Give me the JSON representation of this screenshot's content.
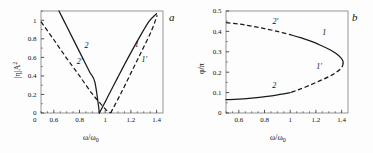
{
  "figure": {
    "background": "#fdfdfd",
    "curve_color": "#1a1a1a",
    "frame_color": "#8a8a8a"
  },
  "panel_a": {
    "tag": "a",
    "xlabel_main": "ω/ω",
    "xlabel_sub": "0",
    "ylabel_main": "|η|A",
    "ylabel_sup": "2"
  },
  "panel_b": {
    "tag": "b",
    "xlabel_main": "ω/ω",
    "xlabel_sub": "0",
    "ylabel_main": "φ/π"
  },
  "chart_data": [
    {
      "type": "line",
      "panel": "a",
      "title": "",
      "xlabel": "ω/ω₀",
      "ylabel": "|η|A²",
      "xlim": [
        0.5,
        1.45
      ],
      "ylim": [
        0,
        1.1
      ],
      "xticks": [
        0.6,
        0.8,
        1,
        1.2,
        1.4
      ],
      "xtick_labels": [
        "0.6",
        "0.8",
        "1",
        "1.2",
        "1.4"
      ],
      "yticks": [
        0,
        0.2,
        0.4,
        0.6,
        0.8,
        1
      ],
      "ytick_labels": [
        "0",
        "0.2",
        "0.4",
        "0.6",
        "0.8",
        "1"
      ],
      "zero_label": "0",
      "grid": false,
      "legend": "inline-curve-labels",
      "series": [
        {
          "name": "2",
          "style": "solid",
          "label": "2",
          "label_x": 0.855,
          "label_y": 0.7,
          "points": [
            [
              0.64,
              1.1
            ],
            [
              0.7,
              0.935
            ],
            [
              0.76,
              0.77
            ],
            [
              0.82,
              0.605
            ],
            [
              0.88,
              0.44
            ],
            [
              0.92,
              0.33
            ],
            [
              0.955,
              0.0
            ]
          ]
        },
        {
          "name": "1",
          "style": "solid",
          "label": "1",
          "label_x": 1.245,
          "label_y": 0.715,
          "points": [
            [
              0.955,
              0.0
            ],
            [
              1.02,
              0.175
            ],
            [
              1.1,
              0.39
            ],
            [
              1.18,
              0.6
            ],
            [
              1.26,
              0.8
            ],
            [
              1.34,
              0.985
            ],
            [
              1.4,
              1.07
            ]
          ]
        },
        {
          "name": "2'",
          "style": "dashed",
          "label": "2′",
          "label_x": 0.8,
          "label_y": 0.525,
          "points": [
            [
              0.5,
              0.985
            ],
            [
              0.6,
              0.79
            ],
            [
              0.7,
              0.59
            ],
            [
              0.8,
              0.4
            ],
            [
              0.9,
              0.205
            ],
            [
              1.0,
              0.045
            ],
            [
              1.042,
              0.0
            ]
          ]
        },
        {
          "name": "1'",
          "style": "dashed",
          "label": "1′",
          "label_x": 1.305,
          "label_y": 0.545,
          "points": [
            [
              1.042,
              0.0
            ],
            [
              1.12,
              0.205
            ],
            [
              1.2,
              0.43
            ],
            [
              1.28,
              0.655
            ],
            [
              1.36,
              0.885
            ],
            [
              1.405,
              1.055
            ]
          ]
        }
      ]
    },
    {
      "type": "line",
      "panel": "b",
      "title": "",
      "xlabel": "ω/ω₀",
      "ylabel": "φ/π",
      "xlim": [
        0.5,
        1.45
      ],
      "ylim": [
        0,
        0.5
      ],
      "xticks": [
        0.6,
        0.8,
        1,
        1.2,
        1.4
      ],
      "xtick_labels": [
        "0.6",
        "0.8",
        "1",
        "1.2",
        "1.4"
      ],
      "yticks": [
        0,
        0.1,
        0.2,
        0.3,
        0.4,
        0.5
      ],
      "ytick_labels": [
        "0",
        "0.1",
        "0.2",
        "0.3",
        "0.4",
        "0.5"
      ],
      "grid": false,
      "legend": "inline-curve-labels",
      "turning_point": [
        1.41,
        0.245
      ],
      "series": [
        {
          "name": "2'",
          "style": "dashed",
          "label": "2′",
          "label_x": 0.885,
          "label_y": 0.437,
          "points": [
            [
              0.5,
              0.443
            ],
            [
              0.6,
              0.436
            ],
            [
              0.7,
              0.426
            ],
            [
              0.8,
              0.414
            ],
            [
              0.9,
              0.4
            ],
            [
              1.0,
              0.384
            ]
          ]
        },
        {
          "name": "1",
          "style": "solid",
          "label": "1",
          "label_x": 1.265,
          "label_y": 0.382,
          "points": [
            [
              1.0,
              0.384
            ],
            [
              1.08,
              0.369
            ],
            [
              1.16,
              0.352
            ],
            [
              1.24,
              0.331
            ],
            [
              1.31,
              0.31
            ],
            [
              1.36,
              0.29
            ],
            [
              1.395,
              0.27
            ],
            [
              1.41,
              0.255
            ],
            [
              1.412,
              0.245
            ]
          ]
        },
        {
          "name": "1'",
          "style": "dashed",
          "label": "1′",
          "label_x": 1.225,
          "label_y": 0.215,
          "points": [
            [
              1.412,
              0.245
            ],
            [
              1.408,
              0.232
            ],
            [
              1.395,
              0.218
            ],
            [
              1.355,
              0.198
            ],
            [
              1.3,
              0.178
            ],
            [
              1.22,
              0.155
            ],
            [
              1.14,
              0.133
            ],
            [
              1.06,
              0.113
            ],
            [
              1.0,
              0.1
            ]
          ]
        },
        {
          "name": "2",
          "style": "solid",
          "label": "2",
          "label_x": 0.875,
          "label_y": 0.125,
          "points": [
            [
              1.0,
              0.1
            ],
            [
              0.92,
              0.091
            ],
            [
              0.84,
              0.083
            ],
            [
              0.76,
              0.077
            ],
            [
              0.68,
              0.072
            ],
            [
              0.6,
              0.068
            ],
            [
              0.5,
              0.065
            ]
          ]
        }
      ]
    }
  ]
}
